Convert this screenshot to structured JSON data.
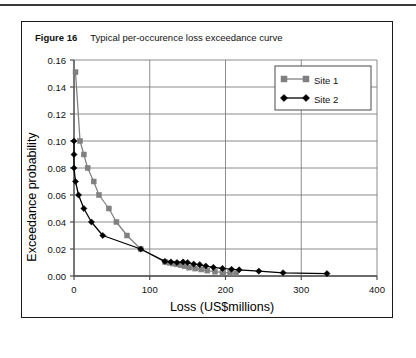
{
  "figure": {
    "label": "Figure 16",
    "title": "Typical per-occurence loss exceedance curve"
  },
  "colors": {
    "site1": "#808080",
    "site2": "#000000",
    "grid": "#808080",
    "axis": "#4d4d4d",
    "frame": "#1a1a1a",
    "background": "#ffffff"
  },
  "chart_data": {
    "type": "line",
    "title": "Typical per-occurence loss exceedance curve",
    "xlabel": "Loss (US$millions)",
    "ylabel": "Exceedance probability",
    "xlim": [
      0,
      400
    ],
    "ylim": [
      0,
      0.16
    ],
    "xticks": [
      0,
      100,
      200,
      300,
      400
    ],
    "xtick_labels": [
      "0",
      "100",
      "200",
      "300",
      "400"
    ],
    "yticks": [
      0.0,
      0.02,
      0.04,
      0.06,
      0.08,
      0.1,
      0.12,
      0.14,
      0.16
    ],
    "ytick_labels": [
      "0.00",
      "0.02",
      "0.04",
      "0.06",
      "0.08",
      "0.10",
      "0.12",
      "0.14",
      "0.16"
    ],
    "grid": "horizontal-and-vertical",
    "legend_position": "top-right",
    "series": [
      {
        "name": "Site 1",
        "color": "#808080",
        "marker": "square",
        "points": [
          [
            2,
            0.151
          ],
          [
            8,
            0.1
          ],
          [
            13,
            0.09
          ],
          [
            18,
            0.08
          ],
          [
            26,
            0.07
          ],
          [
            33,
            0.06
          ],
          [
            46,
            0.05
          ],
          [
            56,
            0.04
          ],
          [
            70,
            0.03
          ],
          [
            88,
            0.02
          ],
          [
            120,
            0.0105
          ],
          [
            126,
            0.0098
          ],
          [
            131,
            0.0092
          ],
          [
            136,
            0.0086
          ],
          [
            141,
            0.008
          ],
          [
            146,
            0.0072
          ],
          [
            152,
            0.0062
          ],
          [
            160,
            0.0055
          ],
          [
            168,
            0.0048
          ],
          [
            176,
            0.004
          ],
          [
            186,
            0.0032
          ],
          [
            196,
            0.0026
          ],
          [
            206,
            0.0022
          ],
          [
            214,
            0.002
          ]
        ]
      },
      {
        "name": "Site 2",
        "color": "#000000",
        "marker": "diamond",
        "points": [
          [
            0,
            0.1
          ],
          [
            0,
            0.09
          ],
          [
            0,
            0.08
          ],
          [
            2,
            0.07
          ],
          [
            6,
            0.06
          ],
          [
            13,
            0.05
          ],
          [
            23,
            0.04
          ],
          [
            38,
            0.03
          ],
          [
            88,
            0.02
          ],
          [
            120,
            0.0108
          ],
          [
            128,
            0.0104
          ],
          [
            136,
            0.01
          ],
          [
            144,
            0.0104
          ],
          [
            150,
            0.01
          ],
          [
            158,
            0.0088
          ],
          [
            166,
            0.0084
          ],
          [
            174,
            0.0074
          ],
          [
            184,
            0.0064
          ],
          [
            196,
            0.0056
          ],
          [
            208,
            0.005
          ],
          [
            218,
            0.0046
          ],
          [
            244,
            0.0036
          ],
          [
            276,
            0.0024
          ],
          [
            334,
            0.0018
          ]
        ]
      }
    ]
  }
}
